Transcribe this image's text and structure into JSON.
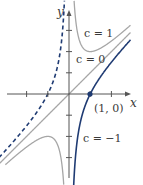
{
  "chart_data": {
    "type": "line",
    "title": "",
    "equation_family": "y = x + c/x",
    "xlabel": "x",
    "ylabel": "y",
    "xlim": [
      -3.3,
      2.9
    ],
    "ylim": [
      -4.3,
      4.5
    ],
    "grid": false,
    "series": [
      {
        "name": "c = 1",
        "c": 1,
        "style": "solid",
        "color": "#a0a0a0",
        "branches": "x>0 and x<0"
      },
      {
        "name": "c = 0",
        "c": 0,
        "style": "solid",
        "color": "#a0a0a0",
        "branches": "line y = x"
      },
      {
        "name": "c = -1",
        "c": -1,
        "style": "solid",
        "color": "#1f3b73",
        "branches": "x>0"
      },
      {
        "name": "c = -1 (x<0)",
        "c": -1,
        "style": "dashed",
        "color": "#1f3b73",
        "branches": "x<0"
      }
    ],
    "annotations": [
      {
        "text": "c = 1",
        "x": 1.0,
        "y": 2.9
      },
      {
        "text": "c = 0",
        "x": 0.9,
        "y": 1.9
      },
      {
        "text": "c = -1",
        "x": 1.3,
        "y": -2.3
      },
      {
        "text": "(1, 0)",
        "x": 1.5,
        "y": -0.7,
        "point": [
          1,
          0
        ]
      }
    ],
    "x_ticks": [
      -2,
      -1,
      1,
      2
    ],
    "y_ticks": [
      -3,
      -2,
      -1,
      1,
      2,
      3
    ]
  },
  "labels": {
    "x_axis": "x",
    "y_axis": "y",
    "c1": "c = 1",
    "c0": "c = 0",
    "cm1": "c = −1",
    "point": "(1, 0)"
  },
  "colors": {
    "axis": "#555555",
    "gray_curve": "#a6a6a6",
    "blue_curve": "#1f3b73"
  }
}
